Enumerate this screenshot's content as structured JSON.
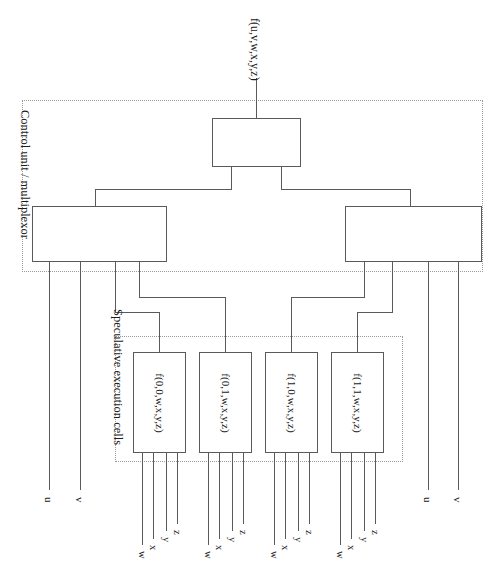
{
  "figure": {
    "type": "block-diagram",
    "title_label": "f(u,v,w,x,y,z)",
    "background_color": "#ffffff",
    "line_color": "#5a5a5a",
    "dashed_color": "#9a9a9a"
  },
  "regions": [
    {
      "id": "control",
      "label": "Control unit / multiplexor"
    },
    {
      "id": "cells",
      "label": "Speculative execution cells"
    }
  ],
  "blocks": {
    "mux_top": {
      "label": ""
    },
    "mux_left": {
      "label": ""
    },
    "mux_right": {
      "label": ""
    }
  },
  "cells": [
    {
      "label": "f(0,0,w,x,y,z)"
    },
    {
      "label": "f(0,1,w,x,y,z)"
    },
    {
      "label": "f(1,0,w,x,y,z)"
    },
    {
      "label": "f(1,1,w,x,y,z)"
    }
  ],
  "control_ports": [
    {
      "label": "u",
      "side": "left"
    },
    {
      "label": "v",
      "side": "left"
    },
    {
      "label": "u",
      "side": "right"
    },
    {
      "label": "v",
      "side": "right"
    }
  ],
  "cell_bus": {
    "letters": [
      "w",
      "x",
      "y",
      "z"
    ]
  },
  "cell_buses": [
    {
      "cell": "f(0,0,w,x,y,z)",
      "letters": [
        "w",
        "x",
        "y",
        "z"
      ]
    },
    {
      "cell": "f(0,1,w,x,y,z)",
      "letters": [
        "w",
        "x",
        "y",
        "z"
      ]
    },
    {
      "cell": "f(1,0,w,x,y,z)",
      "letters": [
        "w",
        "x",
        "y",
        "z"
      ]
    },
    {
      "cell": "f(1,1,w,x,y,z)",
      "letters": [
        "w",
        "x",
        "y",
        "z"
      ]
    }
  ]
}
